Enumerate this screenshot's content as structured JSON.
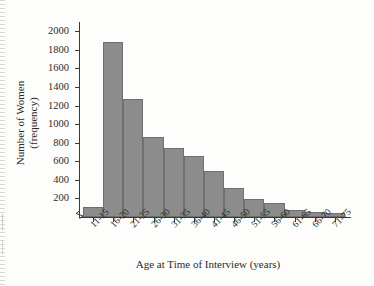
{
  "chart_data": {
    "type": "bar",
    "title": "",
    "subtitle": "",
    "xlabel": "Age at Time of Interview (years)",
    "ylabel_line1": "Number of Women",
    "ylabel_line2": "(frequency)",
    "categories": [
      "11-15",
      "16-20",
      "21-25",
      "26-30",
      "31-35",
      "36-40",
      "41-45",
      "46-50",
      "51-55",
      "56-60",
      "61-65",
      "66-70",
      "71-75"
    ],
    "values": [
      110,
      1890,
      1270,
      860,
      740,
      660,
      500,
      310,
      195,
      150,
      80,
      55,
      40
    ],
    "ylim": [
      0,
      2100
    ],
    "ytick_labels": [
      "200",
      "400",
      "600",
      "800",
      "1000",
      "1200",
      "1400",
      "1600",
      "1800",
      "2000"
    ],
    "ytick_values": [
      200,
      400,
      600,
      800,
      1000,
      1200,
      1400,
      1600,
      1800,
      2000
    ],
    "grid": false,
    "legend": "none",
    "axis_break": "y-axis-zigzag-near-origin",
    "bar_color": "#8c8c8c",
    "bar_edge_color": "#6f6f6f",
    "axis_color": "#3a3a3a",
    "background_color": "#fdfdfb"
  }
}
